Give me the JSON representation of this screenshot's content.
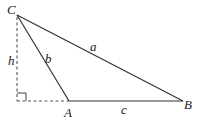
{
  "diagram": {
    "type": "triangle-with-altitude",
    "vertices": {
      "C": {
        "label": "C",
        "x": 17,
        "y": 15
      },
      "A": {
        "label": "A",
        "x": 69,
        "y": 101
      },
      "B": {
        "label": "B",
        "x": 183,
        "y": 101
      }
    },
    "foot": {
      "x": 17,
      "y": 101
    },
    "sides": {
      "a": {
        "label": "a",
        "from": "C",
        "to": "B"
      },
      "b": {
        "label": "b",
        "from": "C",
        "to": "A"
      },
      "c": {
        "label": "c",
        "from": "A",
        "to": "B"
      }
    },
    "altitude": {
      "label": "h",
      "style": "dashed"
    },
    "extension": {
      "style": "dashed",
      "from": "foot",
      "to": "A"
    },
    "right_angle_marker": true,
    "colors": {
      "line": "#333333",
      "dashed": "#555555",
      "text": "#222222"
    }
  }
}
